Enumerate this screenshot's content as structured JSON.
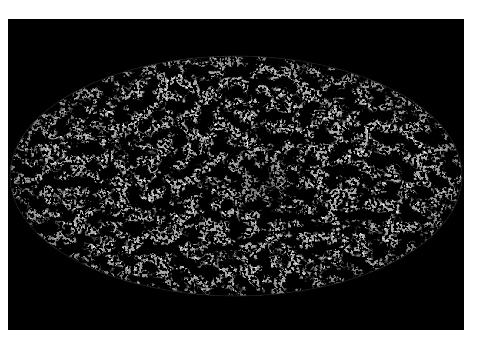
{
  "image": {
    "subject": "all-sky map in Mollweide (elliptical) projection",
    "style": "grayscale mottled texture with dark clumps on light-gray field",
    "background_color": "#000000",
    "page_color": "#ffffff",
    "map_base_color": "#a8a8a8",
    "dark_feature_color": "#0a0a0a",
    "light_speckle_color": "#e8e8e8",
    "ellipse": {
      "cx": 236,
      "cy": 176,
      "rx": 226,
      "ry": 120
    },
    "frame": {
      "x": 8,
      "y": 19,
      "width": 456,
      "height": 311
    }
  }
}
